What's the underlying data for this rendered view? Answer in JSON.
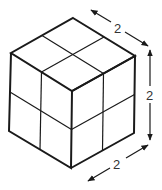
{
  "figure": {
    "grid_divisions": 2,
    "colors": {
      "stroke": "#1a1a1a",
      "background": "#ffffff",
      "text": "#333333"
    }
  },
  "dimensions": [
    {
      "id": "depth",
      "label": "2"
    },
    {
      "id": "height",
      "label": "2"
    },
    {
      "id": "width",
      "label": "2"
    }
  ]
}
